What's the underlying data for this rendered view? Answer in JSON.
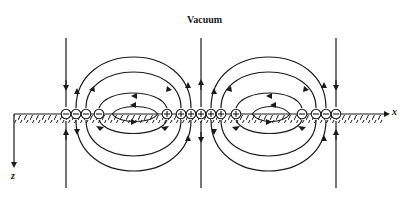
{
  "figure": {
    "title": "Vacuum",
    "x_axis_label": "x",
    "z_axis_label": "z",
    "colors": {
      "ink": "#1a1a1a",
      "background": "#ffffff"
    },
    "surface": {
      "type": "hatched-boundary",
      "y": 114,
      "x_start": 14,
      "x_end": 388
    },
    "charges": [
      {
        "sign": "-",
        "glyph": "⊖",
        "x": 66
      },
      {
        "sign": "-",
        "glyph": "⊖",
        "x": 76
      },
      {
        "sign": "-",
        "glyph": "⊖",
        "x": 86
      },
      {
        "sign": "-",
        "glyph": "⊖",
        "x": 99
      },
      {
        "sign": "+",
        "glyph": "⊕",
        "x": 167
      },
      {
        "sign": "+",
        "glyph": "⊕",
        "x": 181
      },
      {
        "sign": "+",
        "glyph": "⊕",
        "x": 191
      },
      {
        "sign": "+",
        "glyph": "⊕",
        "x": 201
      },
      {
        "sign": "+",
        "glyph": "⊕",
        "x": 211
      },
      {
        "sign": "+",
        "glyph": "⊕",
        "x": 221
      },
      {
        "sign": "+",
        "glyph": "⊕",
        "x": 236
      },
      {
        "sign": "-",
        "glyph": "⊖",
        "x": 302
      },
      {
        "sign": "-",
        "glyph": "⊖",
        "x": 316
      },
      {
        "sign": "-",
        "glyph": "⊖",
        "x": 326
      },
      {
        "sign": "-",
        "glyph": "⊖",
        "x": 336
      }
    ],
    "field_lines": {
      "vertical_lines_x": [
        66,
        201,
        336
      ],
      "description": "Closed field-line loops from + charges to - charges above and below the surface, forming two symmetric lobes"
    }
  }
}
